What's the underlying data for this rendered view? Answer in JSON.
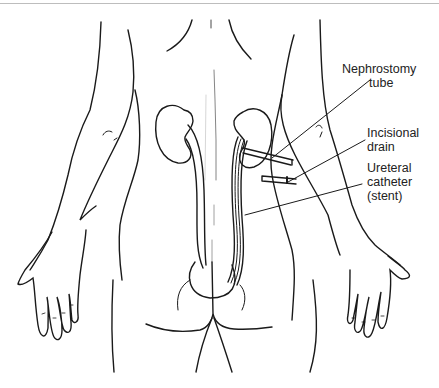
{
  "figure": {
    "labels": [
      {
        "id": "nephrostomy",
        "lines": [
          "Nephrostomy",
          "tube"
        ]
      },
      {
        "id": "incisional",
        "lines": [
          "Incisional",
          "drain"
        ]
      },
      {
        "id": "ureteral",
        "lines": [
          "Ureteral",
          "catheter",
          "(stent)"
        ]
      }
    ]
  },
  "colors": {
    "line": "#1a1a1a",
    "background": "#ffffff",
    "frame": "#bdbdbd"
  }
}
